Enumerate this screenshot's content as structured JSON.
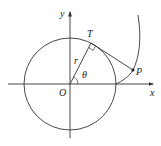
{
  "diagram": {
    "labels": {
      "y_axis": "y",
      "x_axis": "x",
      "origin": "O",
      "tangent_point": "T",
      "point": "P",
      "radius": "r",
      "angle": "θ"
    },
    "colors": {
      "stroke": "#333333",
      "background": "#ffffff"
    }
  }
}
